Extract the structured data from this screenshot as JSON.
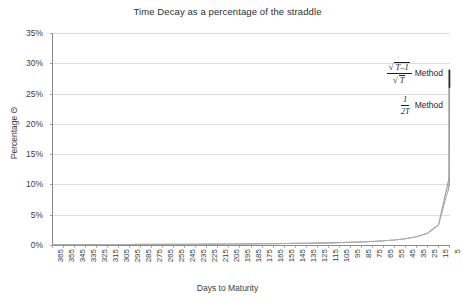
{
  "chart_data": {
    "type": "line",
    "title": "Time Decay as a percentage of the straddle",
    "xlabel": "Days to Maturity",
    "ylabel": "Percentage Θ",
    "grid": true,
    "legend_position": "inside-right-annotations",
    "xlim": [
      365,
      5
    ],
    "ylim": [
      0,
      35
    ],
    "x_tick_labels": [
      "365",
      "355",
      "345",
      "335",
      "325",
      "315",
      "305",
      "295",
      "285",
      "275",
      "265",
      "255",
      "245",
      "235",
      "225",
      "215",
      "205",
      "195",
      "185",
      "175",
      "165",
      "155",
      "145",
      "135",
      "125",
      "115",
      "105",
      "95",
      "85",
      "75",
      "65",
      "55",
      "45",
      "35",
      "25",
      "15",
      "5"
    ],
    "y_tick_labels": [
      "0%",
      "5%",
      "10%",
      "15%",
      "20%",
      "25%",
      "30%",
      "35%"
    ],
    "y_tick_values": [
      0,
      5,
      10,
      15,
      20,
      25,
      30,
      35
    ],
    "x": [
      365,
      355,
      345,
      335,
      325,
      315,
      305,
      295,
      285,
      275,
      265,
      255,
      245,
      235,
      225,
      215,
      205,
      195,
      185,
      175,
      165,
      155,
      145,
      135,
      125,
      115,
      105,
      95,
      85,
      75,
      65,
      55,
      45,
      35,
      25,
      15,
      5
    ],
    "series": [
      {
        "name": "sqrt(T-1)/sqrt(T) Method",
        "color": "#9a9a9a",
        "values": [
          0.14,
          0.14,
          0.14,
          0.15,
          0.15,
          0.16,
          0.16,
          0.17,
          0.18,
          0.18,
          0.19,
          0.2,
          0.2,
          0.21,
          0.22,
          0.23,
          0.24,
          0.26,
          0.27,
          0.29,
          0.3,
          0.32,
          0.35,
          0.37,
          0.4,
          0.44,
          0.48,
          0.53,
          0.59,
          0.67,
          0.78,
          0.92,
          1.12,
          1.44,
          2.02,
          3.4,
          11.4
        ]
      },
      {
        "name": "1/(2T) Method",
        "color": "#adadad",
        "values": [
          0.14,
          0.14,
          0.14,
          0.15,
          0.15,
          0.16,
          0.16,
          0.17,
          0.18,
          0.18,
          0.19,
          0.2,
          0.2,
          0.21,
          0.22,
          0.23,
          0.24,
          0.26,
          0.27,
          0.29,
          0.3,
          0.32,
          0.34,
          0.37,
          0.4,
          0.43,
          0.48,
          0.53,
          0.59,
          0.67,
          0.77,
          0.91,
          1.11,
          1.43,
          2.0,
          3.33,
          10.0
        ]
      }
    ],
    "terminal_spike_value": 29.0,
    "annotations": [
      {
        "id": "sqrt-method",
        "numerator_radical": "√",
        "numerator_body": "T–1",
        "denominator_radical": "√",
        "denominator_body": "T",
        "method_label": "Method"
      },
      {
        "id": "inverse-method",
        "numerator": "1",
        "denominator": "2T",
        "method_label": "Method"
      }
    ],
    "colors": {
      "grid": "#cfcfcf",
      "axis": "#8a8a8a",
      "curve_primary": "#9a9a9a",
      "curve_secondary": "#b4b4b4",
      "spike_cap": "#2b2b2b",
      "text": "#3c3c3c",
      "background": "#ffffff"
    }
  }
}
